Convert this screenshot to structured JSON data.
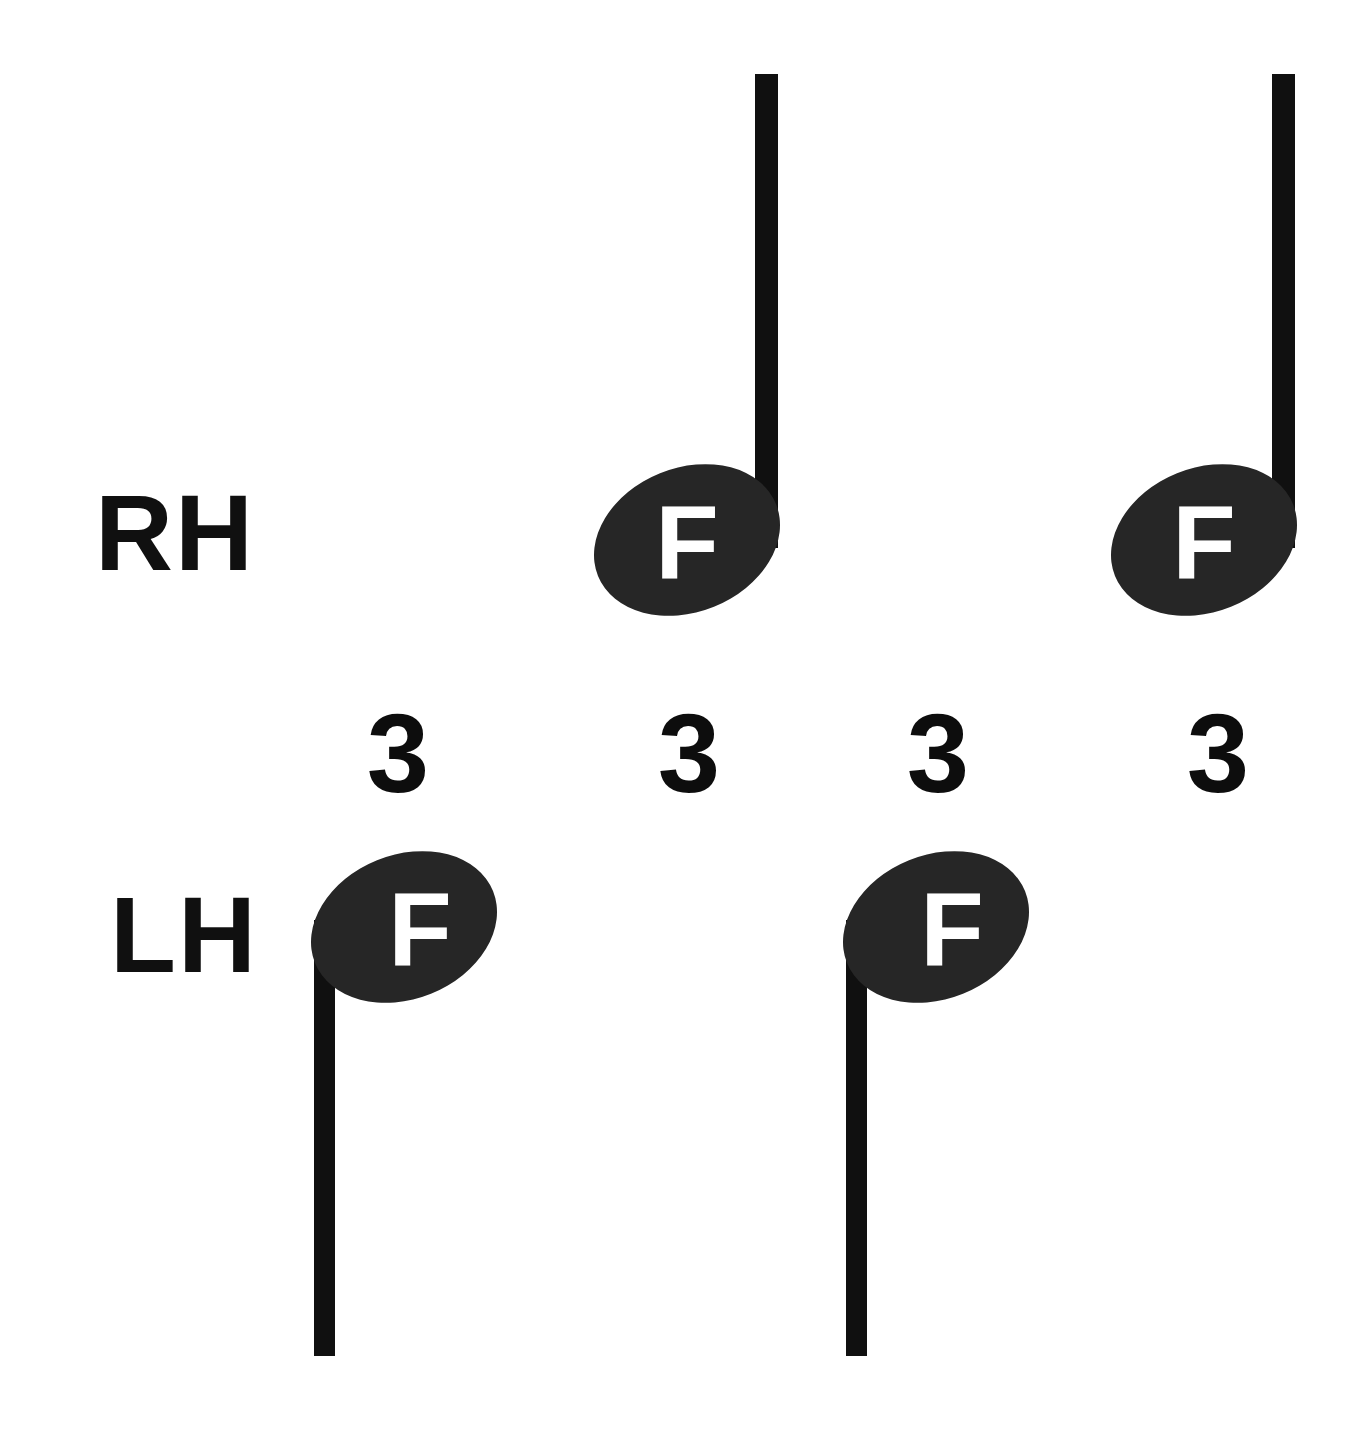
{
  "figure": {
    "type": "music-notation-diagram",
    "background_color": "#ffffff",
    "ink_color": "#101010",
    "notehead_color": "#262626",
    "notehead_letter_color": "#ffffff",
    "width": 1348,
    "height": 1442
  },
  "labels": {
    "right_hand": "RH",
    "left_hand": "LH"
  },
  "tuplet_numbers": [
    {
      "value": "3",
      "x": 398,
      "y": 752
    },
    {
      "value": "3",
      "x": 689,
      "y": 752
    },
    {
      "value": "3",
      "x": 938,
      "y": 752
    },
    {
      "value": "3",
      "x": 1218,
      "y": 752
    }
  ],
  "notes": {
    "right_hand": [
      {
        "letter": "F",
        "stem_direction": "up",
        "head_cx": 687,
        "head_cy": 540,
        "head_rx": 96,
        "head_ry": 72,
        "head_rotation": -22,
        "stem_x": 755,
        "stem_top": 74,
        "stem_bottom": 548,
        "stem_width": 23,
        "letter_x": 687,
        "letter_y": 578
      },
      {
        "letter": "F",
        "stem_direction": "up",
        "head_cx": 1204,
        "head_cy": 540,
        "head_rx": 96,
        "head_ry": 72,
        "head_rotation": -22,
        "stem_x": 1272,
        "stem_top": 74,
        "stem_bottom": 548,
        "stem_width": 23,
        "letter_x": 1204,
        "letter_y": 578
      }
    ],
    "left_hand": [
      {
        "letter": "F",
        "stem_direction": "down",
        "head_cx": 404,
        "head_cy": 927,
        "head_rx": 96,
        "head_ry": 72,
        "head_rotation": -22,
        "stem_x": 314,
        "stem_top": 920,
        "stem_bottom": 1356,
        "stem_width": 21,
        "letter_x": 420,
        "letter_y": 965
      },
      {
        "letter": "F",
        "stem_direction": "down",
        "head_cx": 936,
        "head_cy": 927,
        "head_rx": 96,
        "head_ry": 72,
        "head_rotation": -22,
        "stem_x": 846,
        "stem_top": 920,
        "stem_bottom": 1356,
        "stem_width": 21,
        "letter_x": 952,
        "letter_y": 965
      }
    ]
  },
  "label_positions": {
    "right_hand": {
      "x": 95,
      "y": 570
    },
    "left_hand": {
      "x": 110,
      "y": 972
    }
  }
}
